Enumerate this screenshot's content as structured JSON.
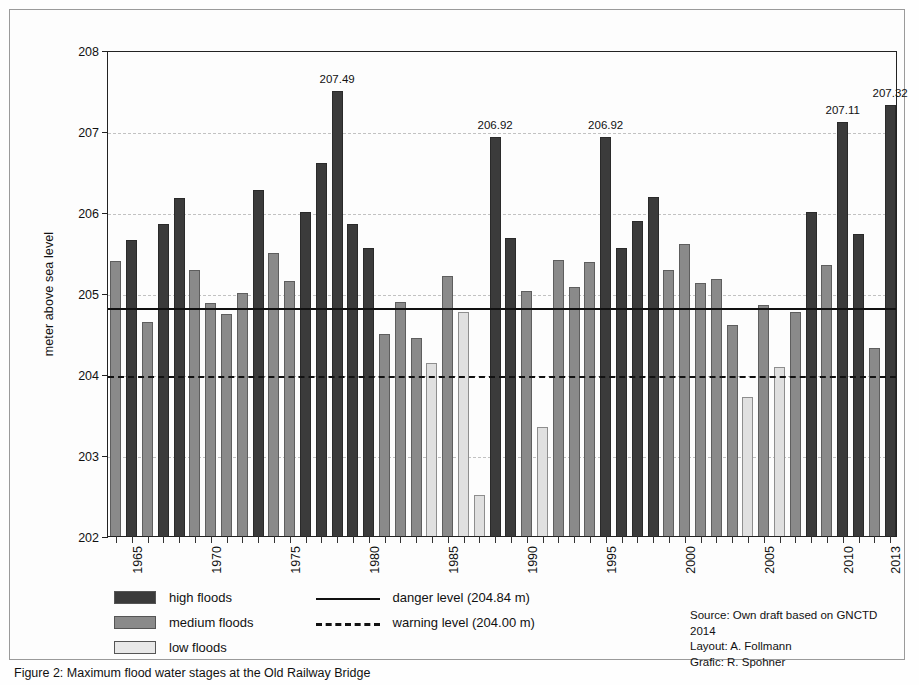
{
  "chart_data": {
    "type": "bar",
    "title": "",
    "xlabel": "",
    "ylabel": "meter above sea level",
    "ylim": [
      202,
      208
    ],
    "yticks": [
      202,
      203,
      204,
      205,
      206,
      207,
      208
    ],
    "xlim": [
      1964,
      2013
    ],
    "xticks": [
      1965,
      1970,
      1975,
      1980,
      1985,
      1990,
      1995,
      2000,
      2005,
      2010,
      2013
    ],
    "grid": true,
    "legend_position": "below-left",
    "categories": [
      1964,
      1965,
      1966,
      1967,
      1968,
      1969,
      1970,
      1971,
      1972,
      1973,
      1974,
      1975,
      1976,
      1977,
      1978,
      1979,
      1980,
      1981,
      1982,
      1983,
      1984,
      1985,
      1986,
      1987,
      1988,
      1989,
      1990,
      1991,
      1992,
      1993,
      1994,
      1995,
      1996,
      1997,
      1998,
      1999,
      2000,
      2001,
      2002,
      2003,
      2004,
      2005,
      2006,
      2007,
      2008,
      2009,
      2010,
      2011,
      2012,
      2013
    ],
    "values": [
      205.4,
      205.65,
      204.64,
      205.85,
      206.17,
      205.28,
      204.88,
      204.74,
      205.0,
      206.27,
      205.49,
      205.15,
      206.0,
      206.6,
      207.49,
      205.85,
      205.55,
      204.49,
      204.89,
      204.45,
      204.13,
      205.21,
      204.76,
      202.51,
      206.92,
      205.68,
      205.02,
      203.35,
      205.41,
      205.07,
      205.38,
      206.92,
      205.55,
      205.89,
      206.18,
      205.29,
      205.61,
      205.12,
      205.17,
      204.6,
      203.72,
      204.85,
      204.09,
      204.76,
      206.0,
      205.34,
      207.11,
      205.73,
      204.32,
      207.32
    ],
    "series": [
      {
        "name": "high floods",
        "color": "#3b3b3b"
      },
      {
        "name": "medium floods",
        "color": "#8a8a8a"
      },
      {
        "name": "low floods",
        "color": "#e0e0e0"
      }
    ],
    "classes": [
      "medium",
      "high",
      "medium",
      "high",
      "high",
      "medium",
      "medium",
      "medium",
      "medium",
      "high",
      "medium",
      "medium",
      "high",
      "high",
      "high",
      "high",
      "high",
      "medium",
      "medium",
      "medium",
      "low",
      "medium",
      "low",
      "low",
      "high",
      "high",
      "medium",
      "low",
      "medium",
      "medium",
      "medium",
      "high",
      "high",
      "high",
      "high",
      "medium",
      "medium",
      "medium",
      "medium",
      "medium",
      "low",
      "medium",
      "low",
      "medium",
      "high",
      "medium",
      "high",
      "high",
      "medium",
      "high"
    ],
    "data_labels": [
      {
        "year": 1978,
        "text": "207.49"
      },
      {
        "year": 1988,
        "text": "206.92"
      },
      {
        "year": 1995,
        "text": "206.92"
      },
      {
        "year": 2010,
        "text": "207.11"
      },
      {
        "year": 2013,
        "text": "207.32"
      }
    ],
    "reference_lines": [
      {
        "name": "danger level",
        "value": 204.84,
        "style": "solid",
        "label": "danger level (204.84 m)"
      },
      {
        "name": "warning level",
        "value": 204.0,
        "style": "dashed",
        "label": "warning level (204.00 m)"
      }
    ],
    "annotations": []
  },
  "legend": {
    "flood_classes": [
      {
        "label": "high floods",
        "class": "high"
      },
      {
        "label": "medium floods",
        "class": "medium"
      },
      {
        "label": "low floods",
        "class": "low"
      }
    ],
    "levels": [
      {
        "label": "danger level (204.84 m)",
        "style": "solid"
      },
      {
        "label": "warning level (204.00 m)",
        "style": "dashed"
      }
    ]
  },
  "credits": {
    "source": "Source: Own draft based on GNCTD 2014",
    "layout": "Layout: A. Follmann",
    "grafic": "Grafic: R. Spohner"
  },
  "caption": {
    "text": "Figure 2: Maximum flood water stages at the Old Railway Bridge"
  },
  "colors": {
    "high": "#3b3b3b",
    "medium": "#8a8a8a",
    "low": "#e0e0e0",
    "axis": "#222222",
    "grid": "#c2c2c2",
    "background": "#fdfdfd"
  }
}
